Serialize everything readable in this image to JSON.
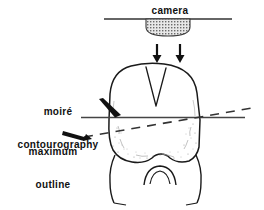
{
  "figure": {
    "background_color": "#ffffff",
    "ink_color": "#111111",
    "width": 264,
    "height": 210
  },
  "labels": {
    "camera": "camera",
    "moire_line1": "moiré",
    "moire_line2": "contourography",
    "maximum_line1": "maximum",
    "maximum_line2": "outline"
  },
  "parts": {
    "camera_body": "camera-body",
    "camera_mount_line": "camera-mount-line",
    "projection_arrow_left": "projection-arrow-left",
    "projection_arrow_right": "projection-arrow-right",
    "tooth": "tooth-outline",
    "occlusal_groove": "occlusal-groove",
    "contourography_plane_line": "contourography-plane-line",
    "maximum_outline_dashed": "maximum-outline-dashed",
    "moire_pointer_arrow": "moire-pointer-arrow",
    "maximum_pointer_arrow": "maximum-pointer-arrow",
    "root_furcation_arch": "root-furcation-arch"
  }
}
